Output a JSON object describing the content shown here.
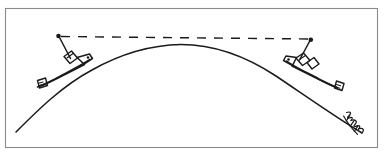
{
  "figure": {
    "title": "Two ships separated by the curvature of the Earth",
    "background_color": "#ffffff",
    "ink_color": "#1a1a1a",
    "frame_color": "#8a8a8a",
    "width": 384,
    "height": 154
  },
  "frame": {
    "name": "diagram-border",
    "x": 5,
    "y": 8,
    "width": 373,
    "height": 140
  },
  "horizon": {
    "label": "curved earth surface",
    "description": "arc of the earth's surface bulging upward at center",
    "path": "M 16 132 C 60 86, 118 50, 180 45 C 244 41, 312 82, 362 133",
    "apex_x": 180,
    "apex_y": 45,
    "left_end_x": 16,
    "left_end_y": 132,
    "right_end_x": 362,
    "right_end_y": 133
  },
  "sight_line": {
    "label": "line of sight between mast tops",
    "style": "dashed",
    "start_x": 60,
    "start_y": 36,
    "end_x": 310,
    "end_y": 39,
    "dash_count": 10
  },
  "ships": [
    {
      "name": "left-ship",
      "side": "left",
      "mast_tip_x": 58,
      "mast_tip_y": 36,
      "mast_base_x": 71,
      "mast_base_y": 59,
      "hull_heading": "down-left along the arc",
      "parts": [
        "mast",
        "antenna-dot",
        "bridge-box",
        "hull",
        "stern-box"
      ]
    },
    {
      "name": "right-ship",
      "side": "right",
      "mast_tip_x": 311,
      "mast_tip_y": 40,
      "mast_base_x": 300,
      "mast_base_y": 60,
      "hull_heading": "down-right along the arc",
      "parts": [
        "mast",
        "antenna-dot",
        "bridge-box",
        "hull",
        "stern-box"
      ]
    }
  ],
  "signature": {
    "name": "artist-signature",
    "text": "",
    "description": "illegible hand-written signature rotated along the arc",
    "x": 355,
    "y": 128,
    "rotation_deg": 52
  }
}
